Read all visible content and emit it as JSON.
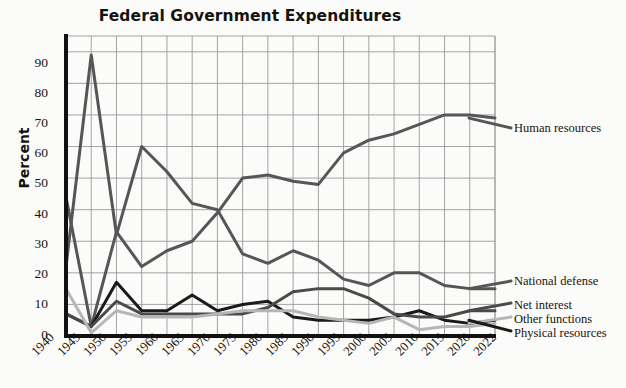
{
  "chart_data": {
    "type": "line",
    "title": "Federal Government Expenditures",
    "xlabel": "",
    "ylabel": "Percent",
    "ylim": [
      0,
      95
    ],
    "yticks": [
      0,
      10,
      20,
      30,
      40,
      50,
      60,
      70,
      80,
      90
    ],
    "grid": true,
    "legend_position": "right-inline",
    "categories": [
      "1940",
      "1945",
      "1950",
      "1955",
      "1960",
      "1965",
      "1970",
      "1975",
      "1980",
      "1985",
      "1990",
      "1995",
      "2000",
      "2005",
      "2010",
      "2015",
      "2020",
      "2022"
    ],
    "series": [
      {
        "name": "Human resources",
        "color": "#565656",
        "values": [
          44,
          3,
          33,
          22,
          27,
          30,
          39,
          50,
          51,
          49,
          48,
          58,
          62,
          64,
          67,
          70,
          70,
          69
        ]
      },
      {
        "name": "National defense",
        "color": "#565656",
        "values": [
          22,
          89,
          32,
          60,
          52,
          42,
          40,
          26,
          23,
          27,
          24,
          18,
          16,
          20,
          20,
          16,
          15,
          15
        ]
      },
      {
        "name": "Physical resources",
        "color": "#1a1a1a",
        "values": [
          7,
          3,
          17,
          8,
          8,
          13,
          8,
          10,
          11,
          6,
          5,
          5,
          5,
          6,
          8,
          5,
          4,
          5
        ]
      },
      {
        "name": "Net interest",
        "color": "#4a4a4a",
        "values": [
          7,
          3,
          11,
          7,
          7,
          7,
          7,
          7,
          9,
          14,
          15,
          15,
          12,
          7,
          6,
          6,
          8,
          8
        ]
      },
      {
        "name": "Other functions",
        "color": "#b6b6b6",
        "values": [
          15,
          1,
          8,
          6,
          6,
          6,
          7,
          8,
          8,
          8,
          6,
          5,
          4,
          6,
          2,
          3,
          3,
          4
        ]
      }
    ],
    "inline_labels": [
      {
        "text": "Human resources",
        "value": 69
      },
      {
        "text": "National defense",
        "value": 15
      },
      {
        "text": "Net interest",
        "value": 8
      },
      {
        "text": "Other functions",
        "value": 4
      },
      {
        "text": "Physical resources",
        "value": 5
      }
    ]
  },
  "axes": {
    "y_label": "Percent",
    "y_ticks": [
      "90",
      "80",
      "70",
      "60",
      "50",
      "40",
      "30",
      "20",
      "10",
      "0"
    ],
    "x_ticks": [
      "1940",
      "1945",
      "1950",
      "1955",
      "1960",
      "1965",
      "1970",
      "1975",
      "1980",
      "1985",
      "1990",
      "1995",
      "2000",
      "2005",
      "2010",
      "2015",
      "2020",
      "2022"
    ]
  },
  "legend": {
    "items": [
      {
        "label": "Human resources"
      },
      {
        "label": "National defense"
      },
      {
        "label": "Net interest"
      },
      {
        "label": "Other functions"
      },
      {
        "label": "Physical resources"
      }
    ]
  },
  "colors": {
    "gray_dark": "#565656",
    "black": "#1a1a1a",
    "gray_mid": "#4a4a4a",
    "gray_light": "#b6b6b6",
    "grid": "#9a9a9a",
    "axis": "#111111",
    "background": "#fbfbfa"
  },
  "title": "Federal Government Expenditures"
}
